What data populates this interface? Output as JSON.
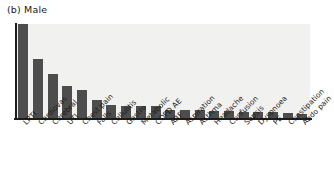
{
  "figure": {
    "panel_label": "(b) Male",
    "colors": {
      "bar": "#4d4d4d",
      "plot_background": "#f1f1f0",
      "axis": "#1c1c1c",
      "text": "#1a1a1a",
      "page_background": "#ffffff"
    }
  },
  "chart_data": {
    "type": "bar",
    "title": "(b) Male",
    "xlabel": "",
    "ylabel": "",
    "grid": false,
    "legend": null,
    "ylim": [
      0,
      100
    ],
    "value_units": "relative frequency (% of maximum)",
    "categories": [
      "LRTI",
      "Cardiovas",
      "Cerebral",
      "UTI",
      "Chest pain",
      "Falls",
      "Cellulitis",
      "Gastro",
      "Metabolic",
      "COPD AE",
      "ARF",
      "Aspiration",
      "Asthma",
      "Headache",
      "Confusion",
      "Sepsis",
      "Dyspnoea",
      "PE",
      "Constipation",
      "Abdo pain"
    ],
    "values": [
      100,
      63,
      47,
      34,
      30,
      19,
      14,
      13,
      13,
      13,
      9,
      9,
      8,
      7,
      7,
      6,
      6,
      6,
      5,
      4
    ]
  }
}
